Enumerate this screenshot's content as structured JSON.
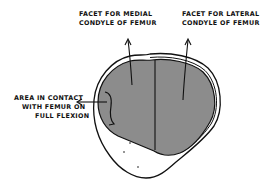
{
  "diagram": {
    "colors": {
      "facet_fill": "#8c8c8c",
      "outline": "#111111",
      "background": "#ffffff"
    },
    "labels": {
      "medial_facet": {
        "line1": "Facet for medial",
        "line2": "condyle of femur"
      },
      "lateral_facet": {
        "line1": "Facet for lateral",
        "line2": "condyle of femur"
      },
      "contact_area": {
        "line1": "Area in contact",
        "line2": "with femur on",
        "line3": "full flexion"
      }
    }
  }
}
